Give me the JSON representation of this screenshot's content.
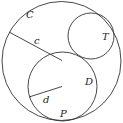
{
  "diagram": {
    "stroke_color": "#333333",
    "circles": [
      {
        "name": "C",
        "cx": 61.5,
        "cy": 61,
        "r": 59.5
      },
      {
        "name": "T",
        "cx": 91,
        "cy": 36,
        "r": 23
      },
      {
        "name": "D",
        "cx": 62.5,
        "cy": 86.5,
        "r": 34.5
      }
    ],
    "segments": [
      {
        "name": "c",
        "x1": 9,
        "y1": 32,
        "x2": 62,
        "y2": 60.5
      },
      {
        "name": "d",
        "x1": 29,
        "y1": 97,
        "x2": 62,
        "y2": 86.5
      }
    ],
    "labels": {
      "C": "C",
      "c": "c",
      "T": "T",
      "D": "D",
      "d": "d",
      "P": "P"
    }
  }
}
